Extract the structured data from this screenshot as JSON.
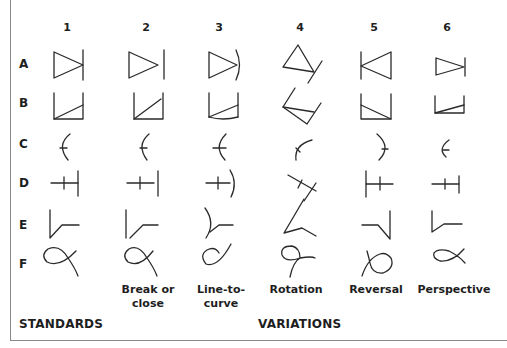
{
  "columns": [
    {
      "number": "1",
      "caption": ""
    },
    {
      "number": "2",
      "caption": "Break or close"
    },
    {
      "number": "3",
      "caption": "Line-to-curve"
    },
    {
      "number": "4",
      "caption": "Rotation"
    },
    {
      "number": "5",
      "caption": "Reversal"
    },
    {
      "number": "6",
      "caption": "Perspective"
    }
  ],
  "rows": [
    {
      "label": "A",
      "shape": "triangle-against-bar"
    },
    {
      "label": "B",
      "shape": "open-box-with-diagonal"
    },
    {
      "label": "C",
      "shape": "arc-with-tick"
    },
    {
      "label": "D",
      "shape": "crossed-line-to-bar"
    },
    {
      "label": "E",
      "shape": "angle-with-line"
    },
    {
      "label": "F",
      "shape": "loop-curve"
    }
  ],
  "captions": {
    "col2_line1": "Break or",
    "col2_line2": "close",
    "col3_line1": "Line-to-",
    "col3_line2": "curve",
    "col4": "Rotation",
    "col5": "Reversal",
    "col6": "Perspective"
  },
  "footer": {
    "standards": "STANDARDS",
    "variations": "VARIATIONS"
  },
  "colors": {
    "ink": "#2a2a2a",
    "frame": "#8a8a8a",
    "background": "#ffffff"
  }
}
